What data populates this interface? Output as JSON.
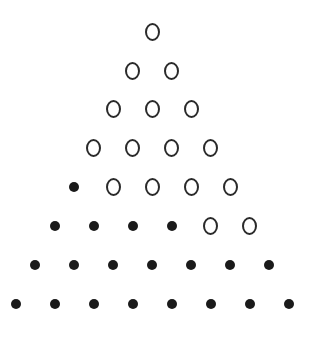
{
  "diagram": {
    "title": "",
    "center_x": 152,
    "row_y": [
      32,
      71,
      109,
      148,
      187,
      226,
      265,
      304
    ],
    "spacing_x": 39,
    "rows": [
      [
        "open"
      ],
      [
        "open",
        "open"
      ],
      [
        "open",
        "open",
        "open"
      ],
      [
        "open",
        "open",
        "open",
        "open"
      ],
      [
        "filled",
        "open",
        "open",
        "open",
        "open"
      ],
      [
        "filled",
        "filled",
        "filled",
        "filled",
        "open",
        "open"
      ],
      [
        "filled",
        "filled",
        "filled",
        "filled",
        "filled",
        "filled",
        "filled"
      ],
      [
        "filled",
        "filled",
        "filled",
        "filled",
        "filled",
        "filled",
        "filled",
        "filled"
      ]
    ],
    "counts": {
      "open": 16,
      "filled": 20,
      "total": 36
    },
    "colors": {
      "stroke": "#2a2a2a",
      "fill": "#1a1a1a",
      "background": "#ffffff"
    }
  }
}
